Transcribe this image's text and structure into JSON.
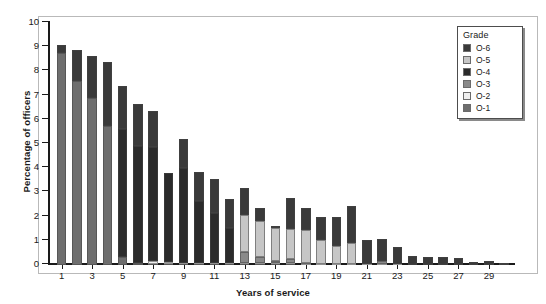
{
  "chart_data": {
    "type": "bar",
    "subtype": "stacked-bar",
    "title": "",
    "xlabel": "Years of service",
    "ylabel": "Percentage of officers",
    "ylim": [
      0,
      10
    ],
    "ytick_labels": [
      "0",
      "1",
      "2",
      "3",
      "4",
      "5",
      "6",
      "7",
      "8",
      "9",
      "10"
    ],
    "ytick_values": [
      0,
      1,
      2,
      3,
      4,
      5,
      6,
      7,
      8,
      9,
      10
    ],
    "xtick_labels": [
      "1",
      "3",
      "5",
      "7",
      "9",
      "11",
      "13",
      "15",
      "17",
      "19",
      "21",
      "23",
      "25",
      "27",
      "29"
    ],
    "grid": false,
    "legend_position": "top-right",
    "legend_title": "Grade",
    "categories": [
      1,
      2,
      3,
      4,
      5,
      6,
      7,
      8,
      9,
      10,
      11,
      12,
      13,
      14,
      15,
      16,
      17,
      18,
      19,
      20,
      21,
      22,
      23,
      24,
      25,
      26,
      27,
      28,
      29,
      30
    ],
    "series": [
      {
        "name": "O-1",
        "color": "#6e6e6e",
        "values": [
          8.75,
          7.6,
          6.9,
          5.75,
          0.35,
          0.1,
          0.05,
          0.04,
          0.04,
          0.04,
          0.03,
          0.03,
          0.03,
          0.03,
          0.03,
          0.03,
          0.02,
          0.02,
          0.02,
          0.02,
          0.02,
          0.02,
          0.02,
          0.01,
          0.01,
          0.01,
          0.01,
          0.01,
          0.01,
          0.01
        ]
      },
      {
        "name": "O-2",
        "color": "#efefef",
        "values": [
          0.0,
          0.0,
          0.0,
          0.0,
          0.0,
          0.0,
          0.12,
          0.08,
          0.06,
          0.05,
          0.04,
          0.04,
          0.04,
          0.04,
          0.04,
          0.04,
          0.03,
          0.03,
          0.03,
          0.03,
          0.02,
          0.02,
          0.02,
          0.01,
          0.01,
          0.01,
          0.01,
          0.01,
          0.01,
          0.01
        ]
      },
      {
        "name": "O-3",
        "color": "#8a8a8a",
        "values": [
          0.0,
          0.0,
          0.0,
          0.0,
          0.0,
          0.0,
          0.0,
          0.0,
          0.0,
          0.0,
          0.0,
          0.0,
          0.45,
          0.25,
          0.1,
          0.18,
          0.05,
          0.0,
          0.0,
          0.0,
          0.0,
          0.12,
          0.0,
          0.0,
          0.0,
          0.0,
          0.0,
          0.0,
          0.0,
          0.0
        ]
      },
      {
        "name": "O-4",
        "color": "#2b2b2b",
        "values": [
          0.0,
          0.0,
          0.0,
          0.0,
          5.25,
          4.8,
          4.7,
          3.7,
          3.9,
          2.55,
          2.1,
          1.45,
          0.0,
          0.0,
          0.0,
          0.0,
          0.0,
          0.0,
          0.0,
          0.0,
          0.0,
          0.0,
          0.0,
          0.0,
          0.0,
          0.0,
          0.0,
          0.0,
          0.0,
          0.0
        ]
      },
      {
        "name": "O-5",
        "color": "#c6c6c6",
        "values": [
          0.0,
          0.0,
          0.0,
          0.0,
          0.0,
          0.0,
          0.0,
          0.0,
          0.0,
          0.0,
          0.0,
          0.0,
          1.55,
          1.5,
          1.35,
          1.25,
          1.35,
          1.0,
          0.75,
          0.85,
          0.0,
          0.0,
          0.0,
          0.0,
          0.0,
          0.0,
          0.0,
          0.0,
          0.0,
          0.0
        ]
      },
      {
        "name": "O-6",
        "color": "#3a3a3a",
        "values": [
          0.35,
          1.3,
          1.75,
          2.65,
          1.8,
          1.75,
          1.5,
          0.0,
          1.2,
          1.2,
          1.4,
          1.2,
          1.1,
          0.55,
          0.1,
          1.25,
          0.9,
          0.95,
          1.2,
          1.55,
          1.0,
          0.9,
          0.7,
          0.35,
          0.3,
          0.3,
          0.25,
          0.12,
          0.14,
          0.08
        ]
      }
    ],
    "totals": [
      9.1,
      8.9,
      8.65,
      8.4,
      7.4,
      6.65,
      6.37,
      3.82,
      5.2,
      3.84,
      3.57,
      2.72,
      3.17,
      2.37,
      1.62,
      2.75,
      2.35,
      2.0,
      2.0,
      2.45,
      1.04,
      1.06,
      0.74,
      0.37,
      0.32,
      0.32,
      0.27,
      0.14,
      0.16,
      0.1
    ]
  },
  "legend": {
    "title": "Grade",
    "items": [
      {
        "label": "O-6",
        "color": "#3a3a3a"
      },
      {
        "label": "O-5",
        "color": "#c6c6c6"
      },
      {
        "label": "O-4",
        "color": "#2b2b2b"
      },
      {
        "label": "O-3",
        "color": "#8a8a8a"
      },
      {
        "label": "O-2",
        "color": "#efefef"
      },
      {
        "label": "O-1",
        "color": "#6e6e6e"
      }
    ]
  }
}
